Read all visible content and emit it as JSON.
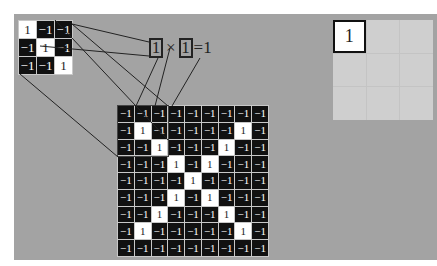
{
  "filter": {
    "rows": [
      [
        "1",
        "−1",
        "−1"
      ],
      [
        "−1",
        "1",
        "−1"
      ],
      [
        "−1",
        "−1",
        "1"
      ]
    ]
  },
  "image": {
    "rows": [
      [
        "−1",
        "−1",
        "−1",
        "−1",
        "−1",
        "−1",
        "−1",
        "−1",
        "−1"
      ],
      [
        "−1",
        "1",
        "−1",
        "−1",
        "−1",
        "−1",
        "−1",
        "1",
        "−1"
      ],
      [
        "−1",
        "−1",
        "1",
        "−1",
        "−1",
        "−1",
        "1",
        "−1",
        "−1"
      ],
      [
        "−1",
        "−1",
        "−1",
        "1",
        "−1",
        "1",
        "−1",
        "−1",
        "−1"
      ],
      [
        "−1",
        "−1",
        "−1",
        "−1",
        "1",
        "−1",
        "−1",
        "−1",
        "−1"
      ],
      [
        "−1",
        "−1",
        "−1",
        "1",
        "−1",
        "1",
        "−1",
        "−1",
        "−1"
      ],
      [
        "−1",
        "−1",
        "1",
        "−1",
        "−1",
        "−1",
        "1",
        "−1",
        "−1"
      ],
      [
        "−1",
        "1",
        "−1",
        "−1",
        "−1",
        "−1",
        "−1",
        "1",
        "−1"
      ],
      [
        "−1",
        "−1",
        "−1",
        "−1",
        "−1",
        "−1",
        "−1",
        "−1",
        "−1"
      ]
    ]
  },
  "equation": {
    "left": "1",
    "operator": "×",
    "right": "1",
    "equals": "=",
    "result": "1"
  },
  "output": {
    "cells": [
      "1",
      "",
      "",
      "",
      "",
      "",
      "",
      "",
      ""
    ]
  },
  "colors": {
    "panel": "#a3a3a3",
    "negative_cell": "#111111",
    "positive_cell": "#ffffff",
    "output_empty": "#cfcfcf"
  }
}
